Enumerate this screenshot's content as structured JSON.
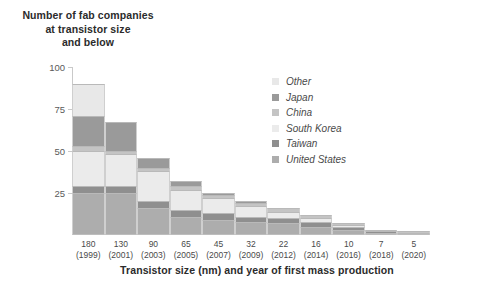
{
  "title": "Number of fab companies\nat transistor size\nand below",
  "axis": {
    "x_title": "Transistor size (nm) and year of first mass production",
    "y_ticks": [
      "100",
      "75",
      "50",
      "25"
    ],
    "y_tick_values": [
      100,
      75,
      50,
      25
    ]
  },
  "legend": {
    "items": [
      {
        "label": "Other",
        "color": "#e8e8e8"
      },
      {
        "label": "Japan",
        "color": "#9a9a9a"
      },
      {
        "label": "China",
        "color": "#c4c4c4"
      },
      {
        "label": "South Korea",
        "color": "#ebebeb"
      },
      {
        "label": "Taiwan",
        "color": "#8f8f8f"
      },
      {
        "label": "United States",
        "color": "#adadad"
      }
    ]
  },
  "chart_data": {
    "type": "bar",
    "title": "Number of fab companies at transistor size and below",
    "xlabel": "Transistor size (nm) and year of first mass production",
    "ylabel": "Number of fab companies at transistor size and below",
    "ylim": [
      0,
      100
    ],
    "grid": false,
    "legend_position": "inside-top-right",
    "stacked": true,
    "categories": [
      "180\n(1999)",
      "130\n(2001)",
      "90\n(2003)",
      "65\n(2005)",
      "45\n(2007)",
      "32\n(2009)",
      "22\n(2012)",
      "16\n(2014)",
      "10\n(2016)",
      "7\n(2018)",
      "5\n(2020)"
    ],
    "category_sizes_nm": [
      180,
      130,
      90,
      65,
      45,
      32,
      22,
      16,
      10,
      7,
      5
    ],
    "category_years": [
      1999,
      2001,
      2003,
      2005,
      2007,
      2009,
      2012,
      2014,
      2016,
      2018,
      2020
    ],
    "series": [
      {
        "name": "Other",
        "color": "#e8e8e8",
        "values": [
          19,
          0,
          0,
          0,
          0,
          0,
          0,
          0,
          0,
          0,
          0
        ]
      },
      {
        "name": "Japan",
        "color": "#9a9a9a",
        "values": [
          18,
          17,
          6,
          3,
          1,
          1,
          0,
          0,
          0,
          0,
          0
        ]
      },
      {
        "name": "China",
        "color": "#c4c4c4",
        "values": [
          3,
          2,
          2,
          2,
          2,
          2,
          2,
          2,
          1,
          1,
          1
        ]
      },
      {
        "name": "South Korea",
        "color": "#ebebeb",
        "values": [
          21,
          19,
          18,
          12,
          9,
          6,
          4,
          2,
          1,
          0,
          0
        ]
      },
      {
        "name": "Taiwan",
        "color": "#8f8f8f",
        "values": [
          4,
          4,
          4,
          4,
          4,
          3,
          3,
          3,
          2,
          1,
          1
        ]
      },
      {
        "name": "United States",
        "color": "#adadad",
        "values": [
          25,
          25,
          16,
          11,
          9,
          8,
          7,
          5,
          3,
          1,
          0
        ]
      }
    ],
    "totals": [
      90,
      67,
      46,
      32,
      25,
      20,
      16,
      12,
      7,
      3,
      2
    ]
  }
}
